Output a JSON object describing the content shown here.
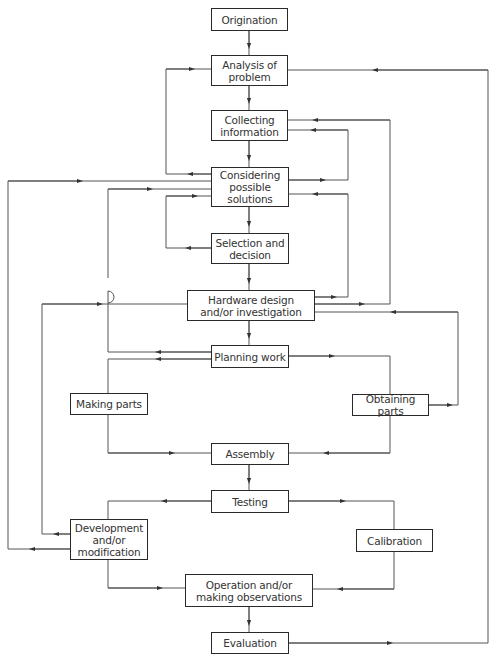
{
  "diagram": {
    "type": "flowchart",
    "colors": {
      "line": "#555555",
      "box_border": "#2a2a2a",
      "text": "#333333",
      "background": "#ffffff"
    },
    "nodes": {
      "origination": "Origination",
      "analysis": "Analysis of\nproblem",
      "collecting": "Collecting\ninformation",
      "considering": "Considering\npossible\nsolutions",
      "selection": "Selection and\ndecision",
      "hardware": "Hardware design\nand/or investigation",
      "planning": "Planning work",
      "making": "Making parts",
      "obtaining": "Obtaining parts",
      "assembly": "Assembly",
      "testing": "Testing",
      "development": "Development\nand/or\nmodification",
      "calibration": "Calibration",
      "operation": "Operation and/or\nmaking observations",
      "evaluation": "Evaluation"
    },
    "edges": [
      {
        "from": "Origination",
        "to": "Analysis of problem"
      },
      {
        "from": "Analysis of problem",
        "to": "Collecting information"
      },
      {
        "from": "Collecting information",
        "to": "Considering possible solutions"
      },
      {
        "from": "Considering possible solutions",
        "to": "Analysis of problem"
      },
      {
        "from": "Considering possible solutions",
        "to": "Collecting information"
      },
      {
        "from": "Considering possible solutions",
        "to": "Selection and decision"
      },
      {
        "from": "Selection and decision",
        "to": "Considering possible solutions"
      },
      {
        "from": "Selection and decision",
        "to": "Hardware design and/or investigation"
      },
      {
        "from": "Hardware design and/or investigation",
        "to": "Considering possible solutions"
      },
      {
        "from": "Hardware design and/or investigation",
        "to": "Collecting information"
      },
      {
        "from": "Hardware design and/or investigation",
        "to": "Planning work"
      },
      {
        "from": "Planning work",
        "to": "Considering possible solutions"
      },
      {
        "from": "Planning work",
        "to": "Making parts"
      },
      {
        "from": "Planning work",
        "to": "Obtaining parts"
      },
      {
        "from": "Obtaining parts",
        "to": "Hardware design and/or investigation"
      },
      {
        "from": "Making parts",
        "to": "Assembly"
      },
      {
        "from": "Obtaining parts",
        "to": "Assembly"
      },
      {
        "from": "Assembly",
        "to": "Testing"
      },
      {
        "from": "Testing",
        "to": "Development and/or modification"
      },
      {
        "from": "Testing",
        "to": "Calibration"
      },
      {
        "from": "Development and/or modification",
        "to": "Hardware design and/or investigation"
      },
      {
        "from": "Development and/or modification",
        "to": "Considering possible solutions"
      },
      {
        "from": "Development and/or modification",
        "to": "Operation and/or making observations"
      },
      {
        "from": "Calibration",
        "to": "Operation and/or making observations"
      },
      {
        "from": "Operation and/or making observations",
        "to": "Evaluation"
      },
      {
        "from": "Evaluation",
        "to": "Analysis of problem"
      }
    ]
  }
}
